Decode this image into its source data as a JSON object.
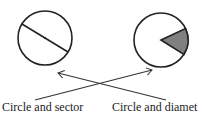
{
  "diagram": {
    "figures": [
      {
        "id": "circle-diameter",
        "type": "circle-with-diameter",
        "cx": 45,
        "cy": 38,
        "r": 27
      },
      {
        "id": "circle-sector",
        "type": "circle-with-shaded-sector",
        "cx": 161,
        "cy": 40,
        "r": 27,
        "sector_fill": "#808080"
      }
    ],
    "labels": [
      {
        "id": "left",
        "text": "Circle and sector"
      },
      {
        "id": "right",
        "text": "Circle and diamet"
      }
    ],
    "arrows": [
      {
        "from": "label-left",
        "to": "circle-sector"
      },
      {
        "from": "label-right",
        "to": "circle-diameter"
      }
    ],
    "colors": {
      "stroke": "#222222",
      "sector": "#808080",
      "background": "#ffffff"
    }
  }
}
